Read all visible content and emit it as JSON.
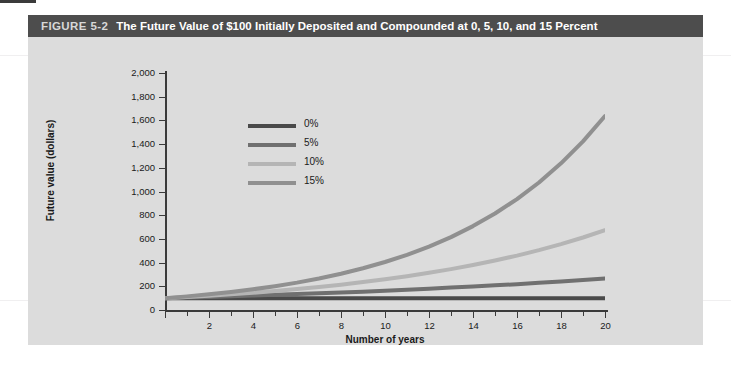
{
  "figure": {
    "number": "FIGURE 5-2",
    "title": "The Future Value of $100 Initially Deposited and Compounded at 0, 5, 10, and 15 Percent"
  },
  "chart_data": {
    "type": "line",
    "title": "The Future Value of $100 Initially Deposited and Compounded at 0, 5, 10, and 15 Percent",
    "xlabel": "Number of years",
    "ylabel": "Future value (dollars)",
    "xlim": [
      0,
      20
    ],
    "ylim": [
      0,
      2000
    ],
    "grid": false,
    "legend_position": "upper-left-inside",
    "x_ticks": [
      0,
      2,
      4,
      6,
      8,
      10,
      12,
      14,
      16,
      18,
      20
    ],
    "x_tick_labels": [
      "",
      "2",
      "4",
      "6",
      "8",
      "10",
      "12",
      "14",
      "16",
      "18",
      "20"
    ],
    "y_ticks": [
      0,
      200,
      400,
      600,
      800,
      1000,
      1200,
      1400,
      1600,
      1800,
      2000
    ],
    "y_tick_labels": [
      "0",
      "200",
      "400",
      "600",
      "800",
      "1,000",
      "1,200",
      "1,400",
      "1,600",
      "1,800",
      "2,000"
    ],
    "x": [
      0,
      1,
      2,
      3,
      4,
      5,
      6,
      7,
      8,
      9,
      10,
      11,
      12,
      13,
      14,
      15,
      16,
      17,
      18,
      19,
      20
    ],
    "series": [
      {
        "name": "0%",
        "color": "#4a4a4a",
        "rate": 0.0,
        "values": [
          100,
          100,
          100,
          100,
          100,
          100,
          100,
          100,
          100,
          100,
          100,
          100,
          100,
          100,
          100,
          100,
          100,
          100,
          100,
          100,
          100
        ]
      },
      {
        "name": "5%",
        "color": "#707070",
        "rate": 0.05,
        "values": [
          100,
          105,
          110,
          116,
          122,
          128,
          134,
          141,
          148,
          155,
          163,
          171,
          180,
          189,
          198,
          208,
          218,
          229,
          241,
          253,
          265
        ]
      },
      {
        "name": "10%",
        "color": "#b5b5b5",
        "rate": 0.1,
        "values": [
          100,
          110,
          121,
          133,
          146,
          161,
          177,
          195,
          214,
          236,
          259,
          285,
          314,
          345,
          380,
          418,
          459,
          505,
          556,
          612,
          673
        ]
      },
      {
        "name": "15%",
        "color": "#909090",
        "rate": 0.15,
        "values": [
          100,
          115,
          132,
          152,
          175,
          201,
          231,
          266,
          306,
          352,
          405,
          465,
          535,
          615,
          708,
          814,
          936,
          1076,
          1238,
          1423,
          1637
        ]
      }
    ]
  }
}
